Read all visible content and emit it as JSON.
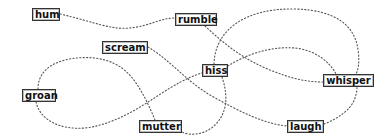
{
  "diagram": {
    "type": "word-network",
    "edge_style": "dotted-curve",
    "edge_color": "#555555",
    "node_border_color": "#333333",
    "nodes": [
      {
        "id": "hum",
        "label": "hum",
        "x": 32,
        "y": 8,
        "w": 28,
        "h": 13
      },
      {
        "id": "rumble",
        "label": "rumble",
        "x": 175,
        "y": 13,
        "w": 42,
        "h": 13
      },
      {
        "id": "scream",
        "label": "scream",
        "x": 102,
        "y": 41,
        "w": 46,
        "h": 13
      },
      {
        "id": "hiss",
        "label": "hiss",
        "x": 202,
        "y": 64,
        "w": 26,
        "h": 13
      },
      {
        "id": "whisper",
        "label": "whisper",
        "x": 323,
        "y": 74,
        "w": 51,
        "h": 13
      },
      {
        "id": "groan",
        "label": "groan",
        "x": 22,
        "y": 89,
        "w": 34,
        "h": 13
      },
      {
        "id": "mutter",
        "label": "mutter",
        "x": 139,
        "y": 120,
        "w": 43,
        "h": 13
      },
      {
        "id": "laugh",
        "label": "laugh",
        "x": 287,
        "y": 120,
        "w": 37,
        "h": 13
      }
    ],
    "edges": [
      {
        "from": "hum",
        "to": "rumble",
        "d": "M60,14 C95,22 110,30 130,28 C150,26 160,18 175,18"
      },
      {
        "from": "rumble",
        "to": "whisper",
        "d": "M205,26 C225,45 245,60 270,70 C290,78 305,82 323,82"
      },
      {
        "from": "scream",
        "to": "laugh",
        "d": "M148,47 C170,60 185,80 210,95 C240,112 265,124 287,126"
      },
      {
        "from": "groan",
        "to": "mutter",
        "d": "M38,89 C38,60 75,56 95,58 C125,62 135,80 145,98 C150,108 153,115 155,120"
      },
      {
        "from": "groan",
        "to": "hiss",
        "d": "M36,102 C40,120 60,130 85,128 C120,124 150,100 170,88 C185,79 195,75 202,73"
      },
      {
        "from": "hiss",
        "to": "whisper",
        "d": "M214,64 C215,30 245,8 295,9 C335,10 355,25 358,50 C360,62 358,70 356,74"
      },
      {
        "from": "hiss",
        "to": "whisper",
        "d": "M228,66 C245,55 270,46 295,48 C315,50 330,62 336,74"
      },
      {
        "from": "hiss",
        "to": "mutter",
        "d": "M222,77 C228,95 228,112 215,125 C205,135 190,136 182,132"
      },
      {
        "from": "laugh",
        "to": "whisper",
        "d": "M324,124 C340,118 352,108 355,98 C357,92 357,89 357,87"
      }
    ]
  }
}
